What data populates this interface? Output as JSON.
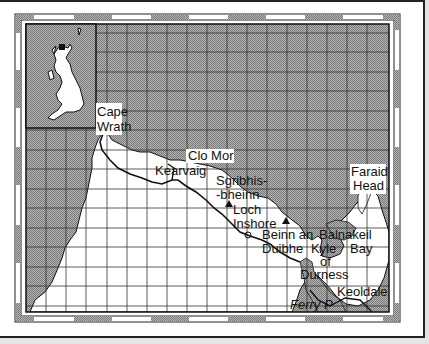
{
  "map": {
    "title": "Cape Wrath to Durness coastal map",
    "colors": {
      "sea": "#9a9a9a",
      "land": "#ffffff",
      "grid": "#333333",
      "frame": "#222222",
      "scale_dark": "#9a9a9a",
      "scale_light": "#ffffff"
    },
    "inset": {
      "label": "UK locator inset",
      "highlight": "north-west Scotland"
    },
    "labels": {
      "cape_wrath_1": "Cape",
      "cape_wrath_2": "Wrath",
      "clo_mor": "Clo Mor",
      "kearvaig": "Kearvaig",
      "sgribhis_1": "Sgribhis-",
      "sgribhis_2": "-bheinn",
      "loch_inshore_1": "Loch",
      "loch_inshore_2": "Inshore",
      "beinn_1": "Beinn an",
      "beinn_2": "Duibhe",
      "faraid_1": "Faraid",
      "faraid_2": "Head",
      "balnakeil_1": "Balnakeil",
      "balnakeil_2": "Bay",
      "kyle_1": "Kyle",
      "kyle_2": "of",
      "kyle_3": "Durness",
      "keoldale": "Keoldale",
      "ferry": "Ferry P"
    },
    "peaks": [
      "Sgribhis-bheinn",
      "Beinn an Duibhe"
    ]
  }
}
